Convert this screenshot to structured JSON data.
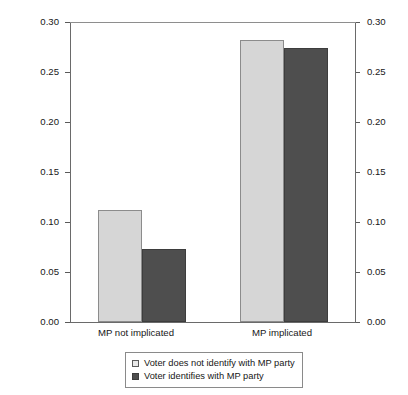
{
  "chart_data": {
    "type": "bar",
    "title": "",
    "xlabel": "",
    "ylabel": "Probability of MP overclaimed perception",
    "ylabel_right": "",
    "ylim": [
      0.0,
      0.3
    ],
    "yticks": [
      "0.00",
      "0.05",
      "0.10",
      "0.15",
      "0.20",
      "0.25",
      "0.30"
    ],
    "ytick_values": [
      0.0,
      0.05,
      0.1,
      0.15,
      0.2,
      0.25,
      0.3
    ],
    "yticks_right": [
      "0.00",
      "0.05",
      "0.10",
      "0.15",
      "0.20",
      "0.25",
      "0.30"
    ],
    "grid": false,
    "legend_position": "below-axis-center",
    "categories": [
      "MP not implicated",
      "MP implicated"
    ],
    "series": [
      {
        "name": "Voter does not identify with MP party",
        "color": "#d6d6d6",
        "edge_color": "#8c8c8c",
        "values": [
          0.112,
          0.282
        ]
      },
      {
        "name": "Voter identifies with MP party",
        "color": "#4e4e4e",
        "edge_color": "#3d3d3d",
        "values": [
          0.073,
          0.274
        ]
      }
    ]
  },
  "axes": {
    "left_label": "Probability of MP overclaimed perception",
    "left_ticks": [
      "0.30",
      "0.25",
      "0.20",
      "0.15",
      "0.10",
      "0.05",
      "0.00"
    ],
    "right_ticks": [
      "0.30",
      "0.25",
      "0.20",
      "0.15",
      "0.10",
      "0.05",
      "0.00"
    ]
  },
  "categories": [
    {
      "label": "MP not implicated"
    },
    {
      "label": "MP implicated"
    }
  ],
  "legend": {
    "entries": [
      {
        "label": "Voter does not identify with MP party",
        "swatch": "light-gray-square-icon"
      },
      {
        "label": "Voter identifies with MP party",
        "swatch": "dark-gray-square-icon"
      }
    ]
  }
}
